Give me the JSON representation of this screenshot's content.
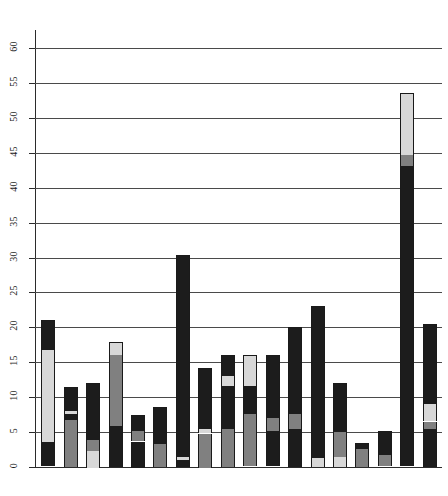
{
  "chart_data": {
    "type": "bar",
    "subtype": "stacked",
    "title": "",
    "subtitle": "",
    "xlabel": "",
    "ylabel": "",
    "ylim": [
      0,
      60
    ],
    "xlim": [
      0,
      17
    ],
    "grid": true,
    "grid_axis": "y",
    "legend": "none",
    "y_ticks": [
      0,
      5,
      10,
      15,
      20,
      25,
      30,
      35,
      40,
      45,
      50,
      55,
      60
    ],
    "y_tick_labels": [
      "0",
      "5",
      "10",
      "15",
      "20",
      "25",
      "30",
      "35",
      "40",
      "45",
      "50",
      "55",
      "60"
    ],
    "x_tick_labels": [],
    "categories": [
      "1",
      "2",
      "3",
      "4",
      "5",
      "6",
      "7",
      "8",
      "9",
      "10",
      "11",
      "12",
      "13",
      "14",
      "15",
      "16",
      "17"
    ],
    "series": [
      {
        "name": "segment-1",
        "color": "#1c1c1c",
        "values": [
          3.5,
          6.8,
          2.4,
          5.9,
          3.7,
          3.4,
          1.0,
          4.8,
          5.4,
          4.6,
          5.2,
          5.4,
          1.3,
          1.4,
          2.6,
          1.6,
          5.5
        ]
      },
      {
        "name": "segment-2",
        "color": "#808080",
        "values": [
          0.0,
          0.8,
          1.6,
          10.1,
          1.5,
          2.0,
          0.0,
          0.4,
          1.0,
          2.2,
          2.6,
          4.0,
          5.4,
          0.0,
          0.0,
          0.0,
          1.0
        ]
      },
      {
        "name": "segment-3",
        "color": "#d8d8d8",
        "values": [
          13.2,
          0.5,
          1.3,
          1.9,
          0.0,
          0.0,
          0.4,
          0.6,
          0.6,
          1.0,
          0.0,
          0.0,
          0.0,
          1.1,
          0.0,
          0.0,
          2.5
        ]
      },
      {
        "name": "segment-4",
        "color": "#1c1c1c",
        "values": [
          4.3,
          3.4,
          6.8,
          0.0,
          2.3,
          3.2,
          28.9,
          8.4,
          5.2,
          4.0,
          12.2,
          10.6,
          5.3,
          9.5,
          0.9,
          3.5,
          11.5
        ]
      },
      {
        "name": "segment-5",
        "color": "#d8d8d8",
        "values": [
          0.0,
          0.0,
          0.0,
          0.0,
          0.0,
          0.0,
          0.0,
          0.0,
          3.8,
          4.2,
          0.0,
          0.0,
          0.0,
          0.0,
          0.0,
          0.0,
          0.0
        ]
      }
    ],
    "bar_totals": [
      21.0,
      11.5,
      12.1,
      17.9,
      7.5,
      8.6,
      30.3,
      14.2,
      16.0,
      16.0,
      20.0,
      20.0,
      12.0,
      12.0,
      3.5,
      5.1,
      20.5
    ],
    "bars": [
      {
        "index": 1,
        "total": 21.0,
        "segments": [
          {
            "shade": "dark",
            "from": 0.0,
            "to": 3.5
          },
          {
            "shade": "light",
            "from": 3.5,
            "to": 16.7
          },
          {
            "shade": "dark",
            "from": 16.7,
            "to": 21.0
          }
        ]
      },
      {
        "index": 2,
        "total": 11.5,
        "segments": [
          {
            "shade": "mid",
            "from": 0.0,
            "to": 6.8
          },
          {
            "shade": "dark",
            "from": 6.8,
            "to": 7.6
          },
          {
            "shade": "light",
            "from": 7.6,
            "to": 8.1
          },
          {
            "shade": "dark",
            "from": 8.1,
            "to": 11.5
          }
        ]
      },
      {
        "index": 3,
        "total": 12.1,
        "segments": [
          {
            "shade": "light",
            "from": 0.0,
            "to": 2.4
          },
          {
            "shade": "mid",
            "from": 2.4,
            "to": 4.0
          },
          {
            "shade": "dark",
            "from": 4.0,
            "to": 12.1
          }
        ]
      },
      {
        "index": 4,
        "total": 17.9,
        "segments": [
          {
            "shade": "dark",
            "from": 0.0,
            "to": 5.9
          },
          {
            "shade": "mid",
            "from": 5.9,
            "to": 16.0
          },
          {
            "shade": "light",
            "from": 16.0,
            "to": 17.9
          }
        ]
      },
      {
        "index": 5,
        "total": 7.5,
        "segments": [
          {
            "shade": "dark",
            "from": 0.0,
            "to": 3.7
          },
          {
            "shade": "mid",
            "from": 3.7,
            "to": 5.2
          },
          {
            "shade": "dark",
            "from": 5.2,
            "to": 7.5
          }
        ]
      },
      {
        "index": 6,
        "total": 8.6,
        "segments": [
          {
            "shade": "mid",
            "from": 0.0,
            "to": 3.4
          },
          {
            "shade": "dark",
            "from": 3.4,
            "to": 5.2
          },
          {
            "shade": "dark",
            "from": 5.2,
            "to": 8.6
          }
        ]
      },
      {
        "index": 7,
        "total": 30.3,
        "segments": [
          {
            "shade": "dark",
            "from": 0.0,
            "to": 1.0
          },
          {
            "shade": "light",
            "from": 1.0,
            "to": 1.4
          },
          {
            "shade": "dark",
            "from": 1.4,
            "to": 30.3
          }
        ]
      },
      {
        "index": 8,
        "total": 14.2,
        "segments": [
          {
            "shade": "mid",
            "from": 0.0,
            "to": 4.8
          },
          {
            "shade": "light",
            "from": 4.8,
            "to": 5.4
          },
          {
            "shade": "dark",
            "from": 5.4,
            "to": 14.2
          }
        ]
      },
      {
        "index": 9,
        "total": 16.0,
        "segments": [
          {
            "shade": "mid",
            "from": 0.0,
            "to": 5.4
          },
          {
            "shade": "dark",
            "from": 5.4,
            "to": 6.4
          },
          {
            "shade": "dark",
            "from": 6.4,
            "to": 11.6
          },
          {
            "shade": "light",
            "from": 11.6,
            "to": 13.0
          },
          {
            "shade": "dark",
            "from": 13.0,
            "to": 16.0
          }
        ]
      },
      {
        "index": 10,
        "total": 16.0,
        "segments": [
          {
            "shade": "mid",
            "from": 0.0,
            "to": 7.5
          },
          {
            "shade": "dark",
            "from": 7.5,
            "to": 11.5
          },
          {
            "shade": "light",
            "from": 11.5,
            "to": 16.0
          }
        ]
      },
      {
        "index": 11,
        "total": 16.0,
        "segments": [
          {
            "shade": "dark",
            "from": 0.0,
            "to": 5.2
          },
          {
            "shade": "mid",
            "from": 5.2,
            "to": 7.0
          },
          {
            "shade": "dark",
            "from": 7.0,
            "to": 16.0
          }
        ]
      },
      {
        "index": 12,
        "total": 20.0,
        "segments": [
          {
            "shade": "dark",
            "from": 0.0,
            "to": 5.4
          },
          {
            "shade": "mid",
            "from": 5.4,
            "to": 7.6
          },
          {
            "shade": "dark",
            "from": 7.6,
            "to": 20.0
          }
        ]
      },
      {
        "index": 13,
        "total": 23.0,
        "segments": [
          {
            "shade": "light",
            "from": 0.0,
            "to": 1.3
          },
          {
            "shade": "dark",
            "from": 1.3,
            "to": 23.0
          }
        ]
      },
      {
        "index": 14,
        "total": 12.0,
        "segments": [
          {
            "shade": "light",
            "from": 0.0,
            "to": 1.4
          },
          {
            "shade": "mid",
            "from": 1.4,
            "to": 5.0
          },
          {
            "shade": "dark",
            "from": 5.0,
            "to": 12.0
          }
        ]
      },
      {
        "index": 15,
        "total": 3.5,
        "segments": [
          {
            "shade": "mid",
            "from": 0.0,
            "to": 2.6
          },
          {
            "shade": "dark",
            "from": 2.6,
            "to": 3.5
          }
        ]
      },
      {
        "index": 16,
        "total": 5.1,
        "segments": [
          {
            "shade": "mid",
            "from": 0.0,
            "to": 1.6
          },
          {
            "shade": "dark",
            "from": 1.6,
            "to": 5.1
          }
        ]
      },
      {
        "index": 17,
        "total": 53.5,
        "segments": [
          {
            "shade": "dark",
            "from": 0.0,
            "to": 43.0
          },
          {
            "shade": "mid",
            "from": 43.0,
            "to": 44.6
          },
          {
            "shade": "light",
            "from": 44.6,
            "to": 53.5
          }
        ]
      },
      {
        "index": 18,
        "total": 20.5,
        "segments": [
          {
            "shade": "dark",
            "from": 0.0,
            "to": 5.5
          },
          {
            "shade": "mid",
            "from": 5.5,
            "to": 6.5
          },
          {
            "shade": "light",
            "from": 6.5,
            "to": 9.0
          },
          {
            "shade": "dark",
            "from": 9.0,
            "to": 20.5
          }
        ]
      }
    ],
    "colors": {
      "dark": "#1c1c1c",
      "mid": "#808080",
      "light": "#d8d8d8",
      "white": "#fdfdfd",
      "axis": "#2b2b2b",
      "grid": "#4a4a4a",
      "background": "#ffffff"
    }
  }
}
